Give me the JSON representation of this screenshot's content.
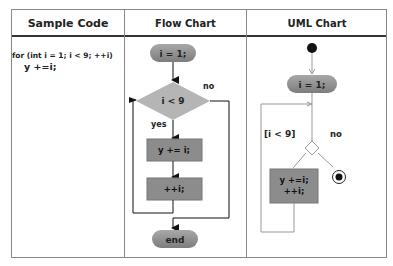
{
  "table": {
    "headers": [
      "Sample Code",
      "Flow Chart",
      "UML Chart"
    ]
  },
  "sample_code": {
    "line1": "for (int i = 1; i < 9; ++i)",
    "line2": "y +=i;"
  },
  "flow_chart": {
    "start": "i = 1;",
    "condition": "i < 9",
    "yes_label": "yes",
    "no_label": "no",
    "body": "y += i;",
    "increment": "++i;",
    "end": "end"
  },
  "uml_chart": {
    "init": "i = 1;",
    "guard": "[i < 9]",
    "no_label": "no",
    "action_line1": "y +=i;",
    "action_line2": "++i;"
  },
  "colors": {
    "node_fill": "#8c8c8c",
    "diamond_fill": "#b5b5b5",
    "border": "#888888",
    "header_rule": "#333333"
  }
}
